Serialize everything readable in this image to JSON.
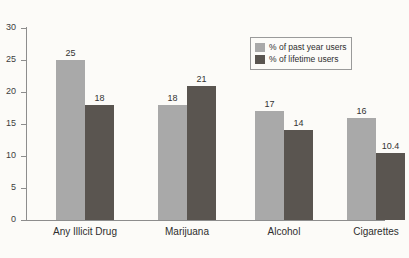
{
  "chart_data": {
    "type": "bar",
    "title": "",
    "subtitle": "",
    "xlabel": "",
    "ylabel": "",
    "ylim": [
      0,
      30
    ],
    "yticks": [
      0,
      5,
      10,
      15,
      20,
      25,
      30
    ],
    "ytick_labels": [
      "0",
      "5",
      "10",
      "15",
      "20",
      "25",
      "30"
    ],
    "grid": false,
    "legend_position": "upper-right-inside",
    "categories": [
      "Any Illicit Drug",
      "Marijuana",
      "Alcohol",
      "Cigarettes"
    ],
    "series": [
      {
        "name": "% of past year users",
        "color": "#a9a9a9",
        "values": [
          25,
          18,
          17,
          16
        ],
        "labels": [
          "25",
          "18",
          "17",
          "16"
        ]
      },
      {
        "name": "% of lifetime users",
        "color": "#5a5550",
        "values": [
          18,
          21,
          14,
          10.4
        ],
        "labels": [
          "18",
          "21",
          "14",
          "10.4"
        ]
      }
    ],
    "bars": [
      {
        "category": "Any Illicit Drug",
        "series": "% of past year users",
        "value": 25,
        "label": "25"
      },
      {
        "category": "Any Illicit Drug",
        "series": "% of lifetime users",
        "value": 18,
        "label": "18"
      },
      {
        "category": "Marijuana",
        "series": "% of past year users",
        "value": 27,
        "label": "27"
      },
      {
        "category": "Marijuana",
        "series": "% of lifetime users",
        "value": 21,
        "label": "21"
      },
      {
        "category": "Alcohol",
        "series": "% of past year users",
        "value": 17,
        "label": "17"
      },
      {
        "category": "Alcohol",
        "series": "% of lifetime users",
        "value": 14,
        "label": "14"
      },
      {
        "category": "Cigarettes",
        "series": "% of past year users",
        "value": 16,
        "label": "16"
      },
      {
        "category": "Cigarettes",
        "series": "% of lifetime users",
        "value": 10.4,
        "label": "10.4"
      }
    ]
  },
  "legend": {
    "entries": [
      {
        "label": "% of past year users",
        "color": "#a9a9a9"
      },
      {
        "label": "% of lifetime users",
        "color": "#5a5550"
      }
    ]
  },
  "colors": {
    "background": "#fcfbf8",
    "axis": "#8d8d8d",
    "text": "#2e2e2e",
    "series_past_year": "#a9a9a9",
    "series_lifetime": "#5a5550"
  }
}
